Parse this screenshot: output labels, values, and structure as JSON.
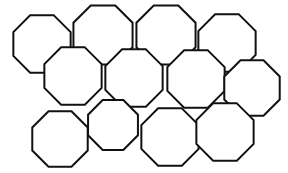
{
  "figure": {
    "background_color": "#ffffff",
    "stroke_color": "#111111",
    "fill_color": "#ffffff",
    "stroke_width": 2,
    "canvas": {
      "width": 288,
      "height": 173
    },
    "shape_type": "octagon",
    "sides": 8,
    "count": 12,
    "rows": 3,
    "columns": 4,
    "shapes": [
      {
        "id": "octagon-r1c1",
        "row": 1,
        "col": 1,
        "cx": 42,
        "cy": 44,
        "r": 31,
        "rotation": 22.5
      },
      {
        "id": "octagon-r1c2",
        "row": 1,
        "col": 2,
        "cx": 103,
        "cy": 35,
        "r": 32,
        "rotation": 22.5
      },
      {
        "id": "octagon-r1c3",
        "row": 1,
        "col": 3,
        "cx": 166,
        "cy": 35,
        "r": 32,
        "rotation": 22.5
      },
      {
        "id": "octagon-r1c4",
        "row": 1,
        "col": 4,
        "cx": 227,
        "cy": 43,
        "r": 31,
        "rotation": 22.5
      },
      {
        "id": "octagon-r2c1",
        "row": 2,
        "col": 1,
        "cx": 73,
        "cy": 76,
        "r": 31,
        "rotation": 22.5
      },
      {
        "id": "octagon-r2c2",
        "row": 2,
        "col": 2,
        "cx": 134,
        "cy": 78,
        "r": 31,
        "rotation": 22.5
      },
      {
        "id": "octagon-r2c3",
        "row": 2,
        "col": 3,
        "cx": 196,
        "cy": 79,
        "r": 31,
        "rotation": 22.5
      },
      {
        "id": "octagon-r2c4",
        "row": 2,
        "col": 4,
        "cx": 252,
        "cy": 88,
        "r": 30,
        "rotation": 22.5
      },
      {
        "id": "octagon-r3c1",
        "row": 3,
        "col": 1,
        "cx": 60,
        "cy": 139,
        "r": 30,
        "rotation": 22.5
      },
      {
        "id": "octagon-r3c2",
        "row": 3,
        "col": 2,
        "cx": 113,
        "cy": 125,
        "r": 27,
        "rotation": 22.5
      },
      {
        "id": "octagon-r3c3",
        "row": 3,
        "col": 3,
        "cx": 170,
        "cy": 137,
        "r": 31,
        "rotation": 22.5
      },
      {
        "id": "octagon-r3c4",
        "row": 3,
        "col": 4,
        "cx": 225,
        "cy": 132,
        "r": 31,
        "rotation": 22.5
      }
    ]
  }
}
